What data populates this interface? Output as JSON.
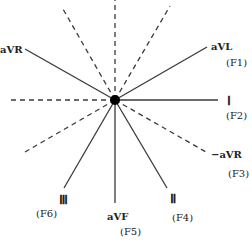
{
  "diagram": {
    "center": {
      "x": 115,
      "y": 100
    },
    "colors": {
      "line": "#3a3a3a",
      "dot": "#000000",
      "text": "#222222"
    },
    "leads": [
      {
        "id": "I",
        "label": "Ⅰ",
        "sub": "(F2)",
        "angle": 0,
        "style": "solid"
      },
      {
        "id": "aVL",
        "label": "aVL",
        "sub": "(F1)",
        "angle": -30,
        "style": "solid"
      },
      {
        "id": "aVR",
        "label": "aVR",
        "sub": "",
        "angle": -150,
        "style": "solid"
      },
      {
        "id": "-aVR",
        "label": "−aVR",
        "sub": "(F3)",
        "angle": 30,
        "style": "dashed"
      },
      {
        "id": "II",
        "label": "Ⅱ",
        "sub": "(F4)",
        "angle": 60,
        "style": "solid"
      },
      {
        "id": "aVF",
        "label": "aVF",
        "sub": "(F5)",
        "angle": 90,
        "style": "solid"
      },
      {
        "id": "III",
        "label": "Ⅲ",
        "sub": "(F6)",
        "angle": 120,
        "style": "solid"
      }
    ],
    "dashed_extensions": [
      180,
      -90,
      -120,
      -60,
      150
    ]
  }
}
